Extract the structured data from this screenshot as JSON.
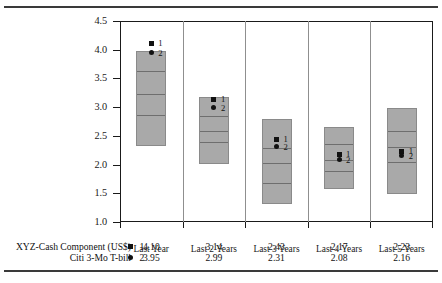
{
  "chart_data": {
    "type": "bar",
    "title": "",
    "xlabel": "",
    "ylabel": "",
    "ylim": [
      1.0,
      4.5
    ],
    "grid": false,
    "legend_position": "bottom-table",
    "categories": [
      "Last Year",
      "Last 2 Years",
      "Last 3 Years",
      "Last 4 Years",
      "Last 5 Years"
    ],
    "yticks": [
      "4.5",
      "4.0",
      "3.5",
      "3.0",
      "2.5",
      "2.0",
      "1.5",
      "1.0"
    ],
    "ytick_values": [
      4.5,
      4.0,
      3.5,
      3.0,
      2.5,
      2.0,
      1.5,
      1.0
    ],
    "ranges": [
      {
        "category": "Last Year",
        "low": 2.33,
        "high": 3.98,
        "quartiles": [
          2.88,
          3.24,
          3.65
        ]
      },
      {
        "category": "Last 2 Years",
        "low": 2.01,
        "high": 3.18,
        "quartiles": [
          2.41,
          2.6,
          2.86
        ]
      },
      {
        "category": "Last 3 Years",
        "low": 1.32,
        "high": 2.8,
        "quartiles": [
          1.7,
          2.04,
          2.31
        ]
      },
      {
        "category": "Last 4 Years",
        "low": 1.58,
        "high": 2.65,
        "quartiles": [
          1.91,
          2.1,
          2.37
        ]
      },
      {
        "category": "Last 5 Years",
        "low": 1.48,
        "high": 2.99,
        "quartiles": [
          2.06,
          2.33,
          2.61
        ]
      }
    ],
    "series": [
      {
        "name": "XYZ-Cash Component (US$)",
        "key": "1",
        "marker": "square",
        "values": [
          4.1,
          3.14,
          2.43,
          2.17,
          2.23
        ]
      },
      {
        "name": "Citi 3-Mo T-bill",
        "key": "2",
        "marker": "circle",
        "values": [
          3.95,
          2.99,
          2.31,
          2.08,
          2.16
        ]
      }
    ]
  },
  "legend": {
    "rows": [
      {
        "name": "XYZ-Cash Component (US$)",
        "key": "1",
        "marker": "square-marker-icon",
        "values": [
          "4.10",
          "3.14",
          "2.43",
          "2.17",
          "2.23"
        ]
      },
      {
        "name": "Citi 3-Mo T-bill",
        "key": "2",
        "marker": "circle-marker-icon",
        "values": [
          "3.95",
          "2.99",
          "2.31",
          "2.08",
          "2.16"
        ]
      }
    ]
  },
  "axis": {
    "y_labels": [
      "4.5",
      "4.0",
      "3.5",
      "3.0",
      "2.5",
      "2.0",
      "1.5",
      "1.0"
    ],
    "x_labels": [
      "Last Year",
      "Last 2 Years",
      "Last 3 Years",
      "Last 4 Years",
      "Last 5 Years"
    ]
  },
  "marker_labels": {
    "series1": "1",
    "series2": "2"
  },
  "colors": {
    "bar_fill": "#a9a9a9",
    "bar_edge": "#8a8a8a",
    "quartile_line": "#6e6e6e",
    "axis": "#1a1a1a",
    "marker": "#111111",
    "rule": "#3a3a3a"
  }
}
